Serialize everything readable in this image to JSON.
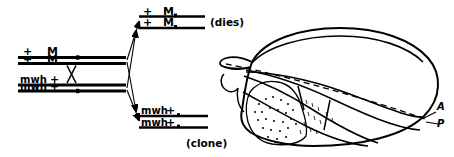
{
  "figure": {
    "kind": "genetics-diagram",
    "ink_color": "#000000",
    "background_color": "#ffffff"
  },
  "parent_cell": {
    "name": "parent-chromosomes",
    "chromosome_pairs": [
      {
        "name": "M-bearing-homolog",
        "chromatids": [
          {
            "left_marker": "+",
            "right_marker": "M"
          },
          {
            "left_marker": "+",
            "right_marker": "M"
          }
        ]
      },
      {
        "name": "mwh-bearing-homolog",
        "chromatids": [
          {
            "left_marker": "mwh",
            "right_marker": "+"
          },
          {
            "left_marker": "mwh",
            "right_marker": "+"
          }
        ]
      }
    ],
    "crossover_symbol": "X"
  },
  "daughter_cells": [
    {
      "name": "daughter-dies",
      "fate_label": "(dies)",
      "chromatids": [
        {
          "left_marker": "+",
          "right_marker": "M"
        },
        {
          "left_marker": "+",
          "right_marker": "M"
        }
      ]
    },
    {
      "name": "daughter-clone",
      "fate_label": "(clone)",
      "chromatids": [
        {
          "left_marker": "mwh",
          "right_marker": "+"
        },
        {
          "left_marker": "mwh",
          "right_marker": "+"
        }
      ]
    }
  ],
  "wing": {
    "name": "drosophila-wing",
    "compartment_labels": {
      "anterior": "A",
      "posterior": "P"
    },
    "boundary_style": "dashed",
    "clone_fill": "stipple"
  }
}
